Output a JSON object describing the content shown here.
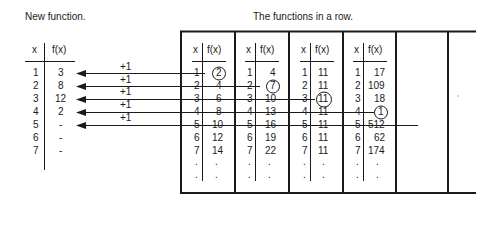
{
  "titles": {
    "new_function": "New function.",
    "functions_row": "The functions in a row."
  },
  "new_function": {
    "headers": {
      "x": "x",
      "fx": "f(x)"
    },
    "rows": [
      {
        "x": "1",
        "fx": "3"
      },
      {
        "x": "2",
        "fx": "8"
      },
      {
        "x": "3",
        "fx": "12"
      },
      {
        "x": "4",
        "fx": "2"
      },
      {
        "x": "5",
        "fx": "-"
      },
      {
        "x": "6",
        "fx": "-"
      },
      {
        "x": "7",
        "fx": "-"
      }
    ]
  },
  "arrows": [
    {
      "label": "+1",
      "from_function": 1,
      "row": 1,
      "circled_value": "2"
    },
    {
      "label": "+1",
      "from_function": 2,
      "row": 2,
      "circled_value": "7"
    },
    {
      "label": "+1",
      "from_function": 3,
      "row": 3,
      "circled_value": "11"
    },
    {
      "label": "+1",
      "from_function": 4,
      "row": 4,
      "circled_value": "1"
    },
    {
      "label": "+1",
      "from_function": 5,
      "row": 5,
      "circled_value": ""
    }
  ],
  "functions": [
    {
      "headers": {
        "x": "x",
        "fx": "f(x)"
      },
      "rows": [
        [
          "1",
          "2"
        ],
        [
          "2",
          "4"
        ],
        [
          "3",
          "6"
        ],
        [
          "4",
          "8"
        ],
        [
          "5",
          "10"
        ],
        [
          "6",
          "12"
        ],
        [
          "7",
          "14"
        ],
        [
          ".",
          "."
        ],
        [
          ".",
          "."
        ]
      ]
    },
    {
      "headers": {
        "x": "x",
        "fx": "f(x)"
      },
      "rows": [
        [
          "1",
          "4"
        ],
        [
          "2",
          "7"
        ],
        [
          "3",
          "10"
        ],
        [
          "4",
          "13"
        ],
        [
          "5",
          "16"
        ],
        [
          "6",
          "19"
        ],
        [
          "7",
          "22"
        ],
        [
          ".",
          "."
        ],
        [
          ".",
          "."
        ]
      ]
    },
    {
      "headers": {
        "x": "x",
        "fx": "f(x)"
      },
      "rows": [
        [
          "1",
          "11"
        ],
        [
          "2",
          "11"
        ],
        [
          "3",
          "11"
        ],
        [
          "4",
          "11"
        ],
        [
          "5",
          "11"
        ],
        [
          "6",
          "11"
        ],
        [
          "7",
          "11"
        ],
        [
          ".",
          "."
        ],
        [
          ".",
          "."
        ]
      ]
    },
    {
      "headers": {
        "x": "x",
        "fx": "f(x)"
      },
      "rows": [
        [
          "1",
          "17"
        ],
        [
          "2",
          "109"
        ],
        [
          "3",
          "18"
        ],
        [
          "4",
          "1"
        ],
        [
          "5",
          "512"
        ],
        [
          "6",
          "62"
        ],
        [
          "7",
          "174"
        ],
        [
          ".",
          "."
        ],
        [
          ".",
          "."
        ]
      ]
    }
  ],
  "colors": {
    "ink": "#1a1a1a",
    "background": "#ffffff"
  }
}
